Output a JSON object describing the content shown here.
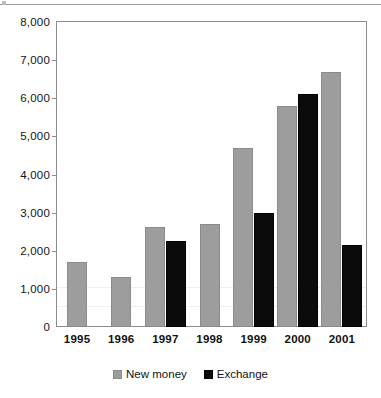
{
  "chart_data": {
    "type": "bar",
    "title": "",
    "subtitle": "",
    "xlabel": "",
    "ylabel": "",
    "categories": [
      "1995",
      "1996",
      "1997",
      "1998",
      "1999",
      "2000",
      "2001"
    ],
    "ylim": [
      0,
      8000
    ],
    "ytick_interval": 1000,
    "ytick_labels": [
      "8,000",
      "7,000",
      "6,000",
      "5,000",
      "4,000",
      "3,000",
      "2,000",
      "1,000",
      "0"
    ],
    "ytick_values": [
      8000,
      7000,
      6000,
      5000,
      4000,
      3000,
      2000,
      1000,
      0
    ],
    "grid": false,
    "legend_position": "bottom-center",
    "series": [
      {
        "name": "New money",
        "color": "#9d9d9d",
        "values": [
          1700,
          1300,
          2620,
          2700,
          4700,
          5800,
          6700
        ]
      },
      {
        "name": "Exchange",
        "color": "#0b0b0b",
        "values": [
          0,
          0,
          2250,
          0,
          3000,
          6120,
          2150
        ]
      }
    ],
    "annotations": []
  },
  "legend": {
    "items": [
      {
        "label": "New money",
        "swatch": "gray-square-swatch"
      },
      {
        "label": "Exchange",
        "swatch": "black-square-swatch"
      }
    ]
  },
  "colors": {
    "new_money": "#9d9d9d",
    "exchange": "#0b0b0b",
    "axis": "#8c8c8c",
    "text": "#121212",
    "background": "#ffffff"
  }
}
